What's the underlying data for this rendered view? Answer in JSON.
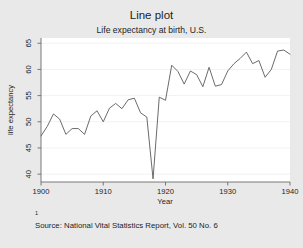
{
  "figure": {
    "title": "Line plot",
    "subtitle": "Life expectancy at birth, U.S.",
    "note_marker": "1",
    "note": "Source:  National Vital Statistics Report, Vol. 50 No. 6",
    "background_color": "#e9e9e9",
    "plot_background_color": "#ffffff",
    "line_color": "#5a5a5a",
    "grid_color": "#f2f2f2",
    "axis_color": "#6b6b6b"
  },
  "chart_data": {
    "type": "line",
    "title": "Line plot",
    "subtitle": "Life expectancy at birth, U.S.",
    "xlabel": "Year",
    "ylabel": "life expectancy",
    "xlim": [
      1900,
      1940
    ],
    "ylim": [
      38.5,
      66
    ],
    "xticks": [
      1900,
      1910,
      1920,
      1930,
      1940
    ],
    "xticklabels": [
      "1900",
      "1910",
      "1920",
      "1930",
      "1940"
    ],
    "yticks": [
      40,
      45,
      50,
      55,
      60,
      65
    ],
    "yticklabels": [
      "40",
      "45",
      "50",
      "55",
      "60",
      "65"
    ],
    "grid": "horizontal",
    "legend": "none",
    "series": [
      {
        "name": "life expectancy",
        "x": [
          1900,
          1901,
          1902,
          1903,
          1904,
          1905,
          1906,
          1907,
          1908,
          1909,
          1910,
          1911,
          1912,
          1913,
          1914,
          1915,
          1916,
          1917,
          1918,
          1919,
          1920,
          1921,
          1922,
          1923,
          1924,
          1925,
          1926,
          1927,
          1928,
          1929,
          1930,
          1931,
          1932,
          1933,
          1934,
          1935,
          1936,
          1937,
          1938,
          1939,
          1940
        ],
        "values": [
          47.3,
          49.1,
          51.5,
          50.5,
          47.6,
          48.7,
          48.7,
          47.6,
          51.1,
          52.1,
          50.0,
          52.6,
          53.5,
          52.5,
          54.2,
          54.5,
          51.7,
          50.9,
          39.1,
          54.7,
          54.1,
          60.8,
          59.6,
          57.2,
          59.7,
          59.0,
          56.7,
          60.4,
          56.8,
          57.1,
          59.7,
          61.1,
          62.1,
          63.3,
          61.1,
          61.7,
          58.5,
          60.0,
          63.5,
          63.7,
          62.9
        ]
      }
    ]
  }
}
